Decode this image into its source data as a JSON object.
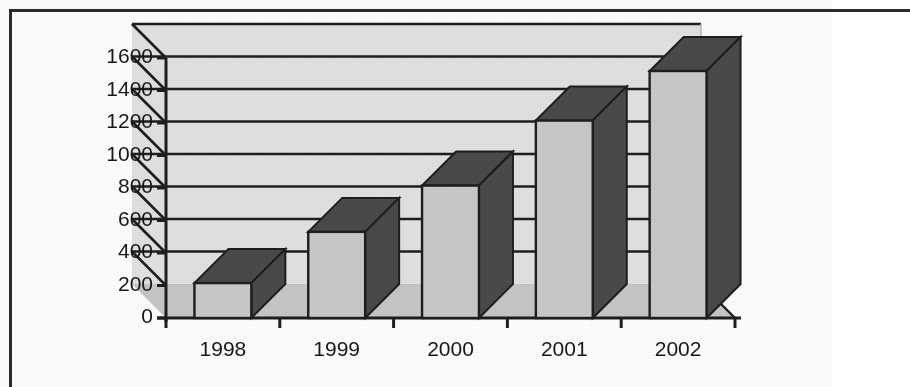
{
  "chart_data": {
    "type": "bar",
    "title": "",
    "subtitle": "",
    "xlabel": "",
    "ylabel": "",
    "categories": [
      "1998",
      "1999",
      "2000",
      "2001",
      "2002"
    ],
    "values": [
      215,
      530,
      815,
      1215,
      1520
    ],
    "ylim": [
      0,
      1600
    ],
    "ytick_step": 200,
    "yticks": [
      "1600",
      "1400",
      "1200",
      "1000",
      "800",
      "600",
      "400",
      "200",
      "0"
    ],
    "grid": true,
    "legend": false,
    "legend_position": "none",
    "style": "3d-column",
    "colors": {
      "bar_face": "#c9c9c9",
      "bar_side": "#4a4a4a",
      "bar_top": "#4a4a4a",
      "bar_outline": "#1e1e1e",
      "plot_background": "#e2e2e2",
      "floor": "#c7c7c7",
      "gridline": "#1e1e1e",
      "axis": "#1e1e1e",
      "text": "#181818",
      "page_border": "#2b2b2b",
      "page_background": "#fefefe"
    }
  },
  "axes": {
    "y_tick_labels": [
      "1600",
      "1400",
      "1200",
      "1000",
      "800",
      "600",
      "400",
      "200",
      "0"
    ],
    "x_tick_labels": [
      "1998",
      "1999",
      "2000",
      "2001",
      "2002"
    ]
  }
}
